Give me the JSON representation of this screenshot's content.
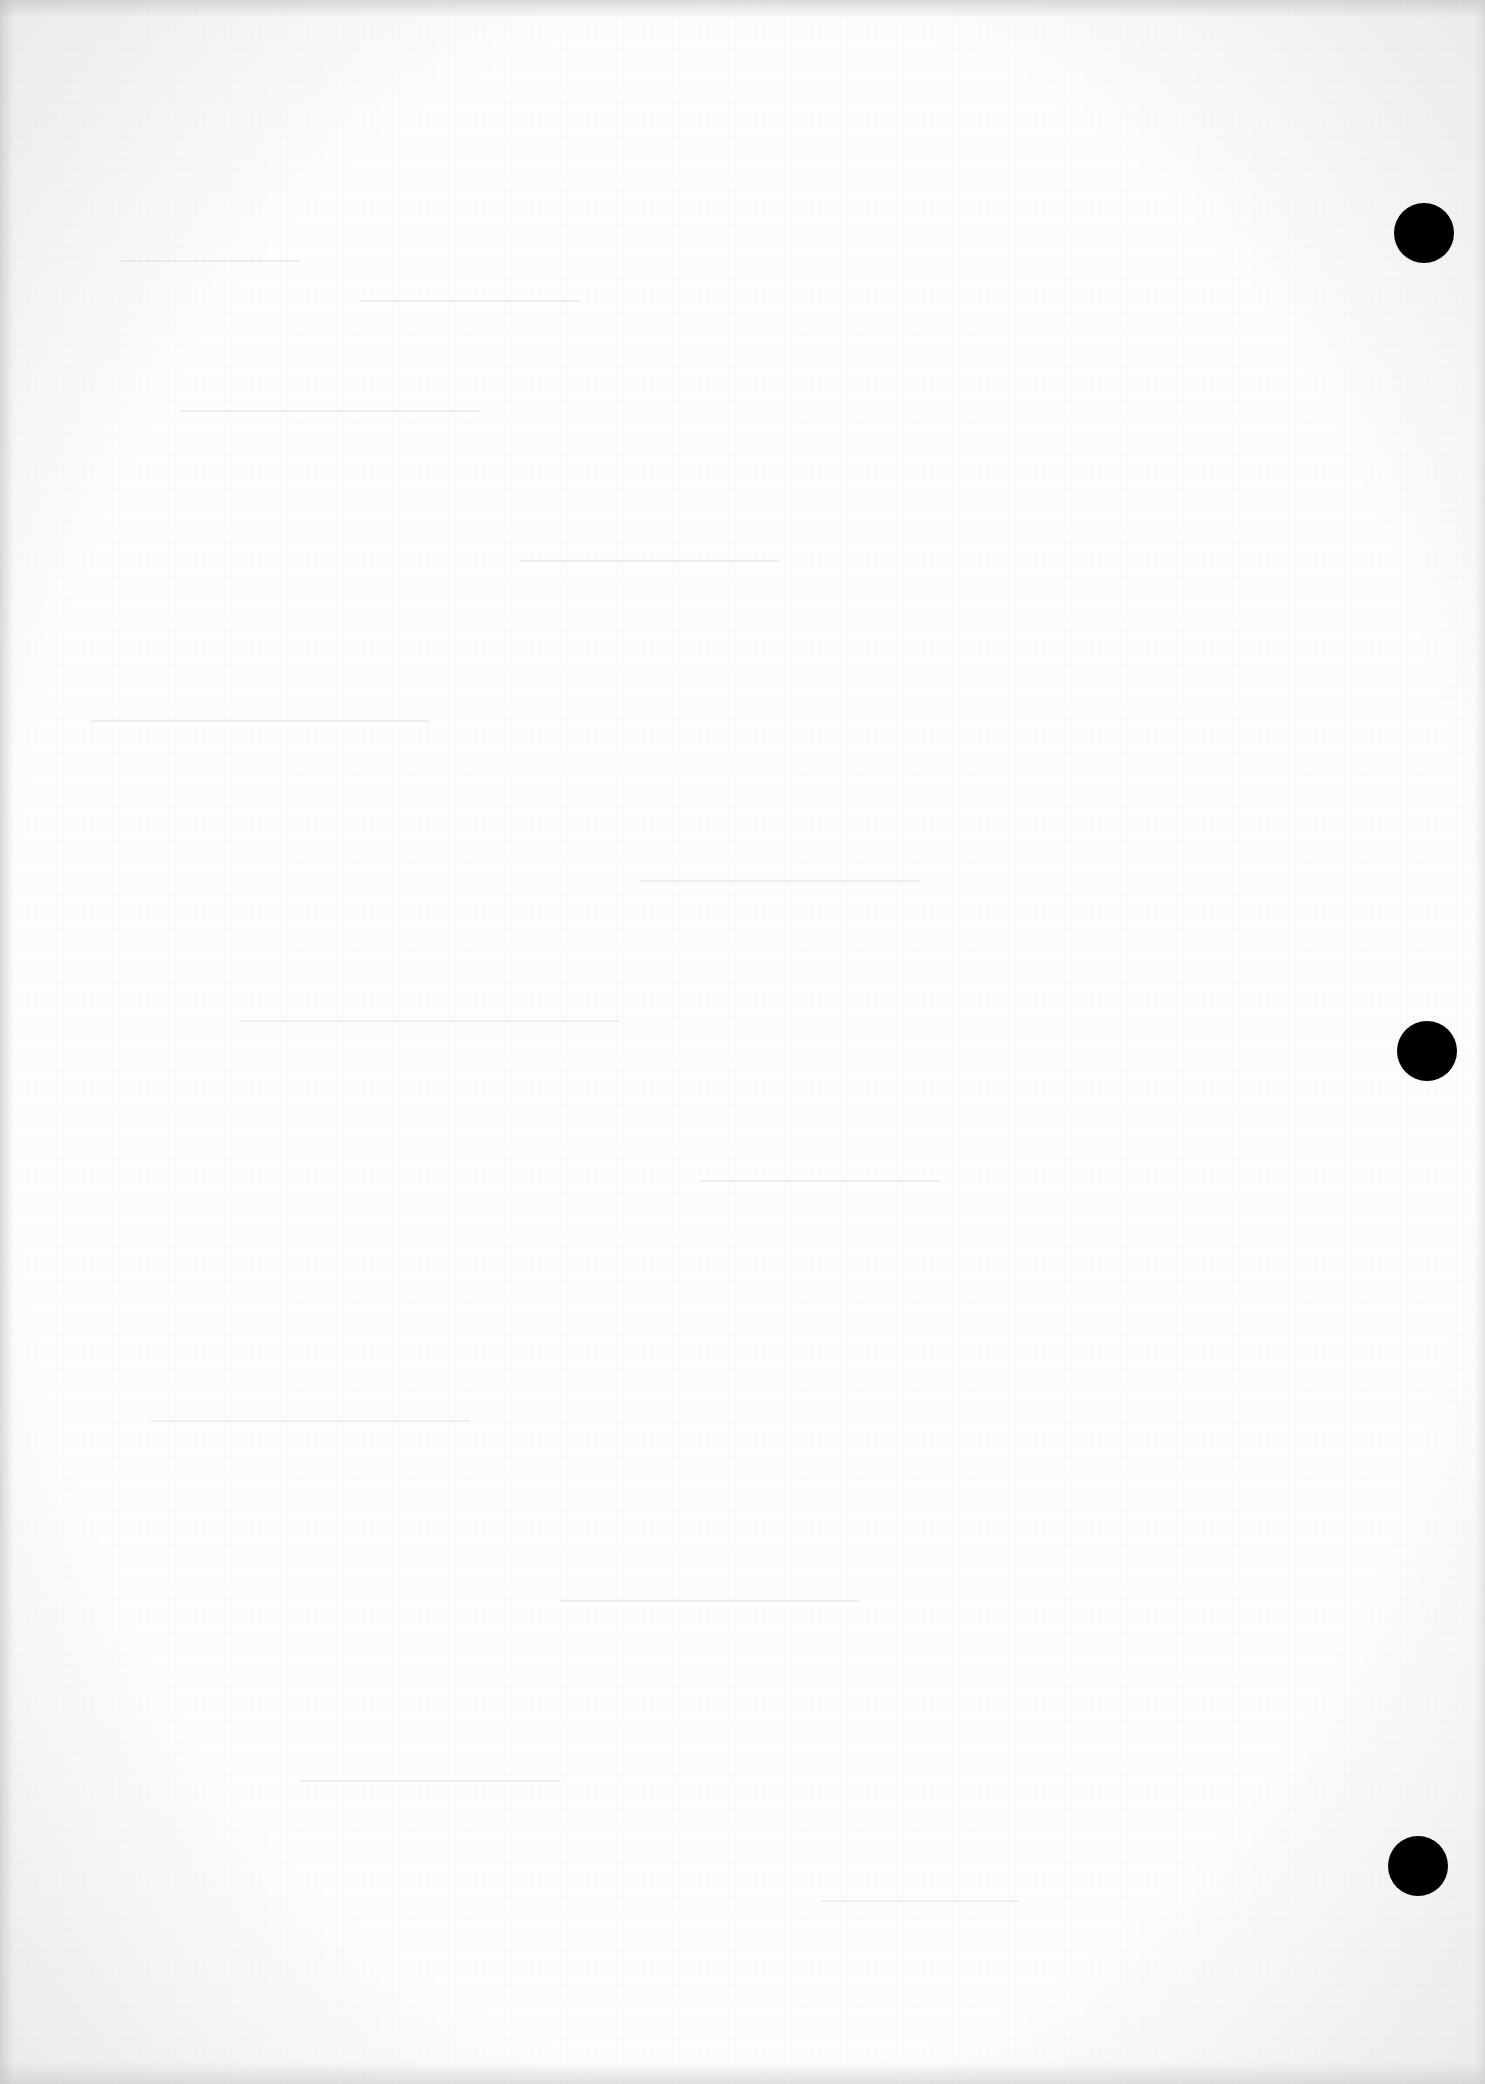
{
  "page": {
    "type": "blank scanned page",
    "text": "",
    "background_color": "#fdfdfd",
    "edge_shading_color": "#c8c8c8"
  },
  "punch_holes": [
    {
      "label": "top-hole",
      "color": "#000000",
      "center_x": 1424,
      "center_y": 233,
      "diameter": 60
    },
    {
      "label": "middle-hole",
      "color": "#000000",
      "center_x": 1427,
      "center_y": 1051,
      "diameter": 60
    },
    {
      "label": "bottom-hole",
      "color": "#000000",
      "center_x": 1418,
      "center_y": 1866,
      "diameter": 60
    }
  ]
}
